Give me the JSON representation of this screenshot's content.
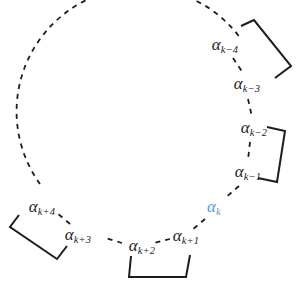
{
  "figure": {
    "type": "diagram",
    "background_color": "#ffffff",
    "stroke_color": "#1d1d1d",
    "highlight_color": "#5b9bd5",
    "alpha_symbol": "α"
  },
  "nodes": [
    {
      "id": "alpha-k-minus-4",
      "alpha": "α",
      "subscript": "k−4",
      "label": "αk−4",
      "x": 225,
      "y": 46,
      "color": "#1d1d1d",
      "highlighted": false
    },
    {
      "id": "alpha-k-minus-3",
      "alpha": "α",
      "subscript": "k−3",
      "label": "αk−3",
      "x": 247,
      "y": 85,
      "color": "#1d1d1d",
      "highlighted": false
    },
    {
      "id": "alpha-k-minus-2",
      "alpha": "α",
      "subscript": "k−2",
      "label": "αk−2",
      "x": 254,
      "y": 129,
      "color": "#1d1d1d",
      "highlighted": false
    },
    {
      "id": "alpha-k-minus-1",
      "alpha": "α",
      "subscript": "k−1",
      "label": "αk−1",
      "x": 248,
      "y": 173,
      "color": "#1d1d1d",
      "highlighted": false
    },
    {
      "id": "alpha-k",
      "alpha": "α",
      "subscript": "k",
      "label": "αk",
      "x": 214,
      "y": 208,
      "color": "#5b9bd5",
      "highlighted": true
    },
    {
      "id": "alpha-k-plus-1",
      "alpha": "α",
      "subscript": "k+1",
      "label": "αk+1",
      "x": 186,
      "y": 237,
      "color": "#1d1d1d",
      "highlighted": false
    },
    {
      "id": "alpha-k-plus-2",
      "alpha": "α",
      "subscript": "k+2",
      "label": "αk+2",
      "x": 142,
      "y": 247,
      "color": "#1d1d1d",
      "highlighted": false
    },
    {
      "id": "alpha-k-plus-3",
      "alpha": "α",
      "subscript": "k+3",
      "label": "αk+3",
      "x": 78,
      "y": 236,
      "color": "#1d1d1d",
      "highlighted": false
    },
    {
      "id": "alpha-k-plus-4",
      "alpha": "α",
      "subscript": "k+4",
      "label": "αk+4",
      "x": 42,
      "y": 208,
      "color": "#1d1d1d",
      "highlighted": false
    }
  ],
  "arc": {
    "id": "dashed-circle-arc",
    "center_x": 140,
    "center_y": 127,
    "radius": 115,
    "start_angle_deg": 150,
    "end_angle_deg": 332,
    "dash_pattern": "5 5",
    "stroke_width": 1.8
  },
  "connectors": [
    {
      "id": "connector-k-4-to-k-3",
      "from": "alpha-k-minus-4",
      "to": "alpha-k-minus-3",
      "x1": 233,
      "y1": 58,
      "x2": 243,
      "y2": 73
    },
    {
      "id": "connector-k-3-to-k-2",
      "from": "alpha-k-minus-3",
      "to": "alpha-k-minus-2",
      "x1": 248,
      "y1": 99,
      "x2": 252,
      "y2": 117
    },
    {
      "id": "connector-k-2-to-k-1",
      "from": "alpha-k-minus-2",
      "to": "alpha-k-minus-1",
      "x1": 250,
      "y1": 142,
      "x2": 248,
      "y2": 160
    },
    {
      "id": "connector-k-1-to-k",
      "from": "alpha-k-minus-1",
      "to": "alpha-k",
      "x1": 239,
      "y1": 186,
      "x2": 224,
      "y2": 199
    },
    {
      "id": "connector-k-to-k-1plus",
      "from": "alpha-k",
      "to": "alpha-k-plus-1",
      "x1": 205,
      "y1": 219,
      "x2": 192,
      "y2": 230
    },
    {
      "id": "connector-k1-to-k2",
      "from": "alpha-k-plus-1",
      "to": "alpha-k-plus-2",
      "x1": 168,
      "y1": 239,
      "x2": 154,
      "y2": 243
    },
    {
      "id": "connector-k2-to-k3",
      "from": "alpha-k-plus-2",
      "to": "alpha-k-plus-3",
      "x1": 122,
      "y1": 243,
      "x2": 104,
      "y2": 238
    },
    {
      "id": "connector-k3-to-k4",
      "from": "alpha-k-plus-3",
      "to": "alpha-k-plus-4",
      "x1": 70,
      "y1": 224,
      "x2": 56,
      "y2": 213
    }
  ],
  "brackets": [
    {
      "id": "bracket-top-right",
      "groups": [
        "alpha-k-minus-4",
        "alpha-k-minus-3"
      ],
      "points": "241,26 254,20 290,67 274,78",
      "tick_length": 9
    },
    {
      "id": "bracket-right",
      "groups": [
        "alpha-k-minus-2",
        "alpha-k-minus-1"
      ],
      "points": "268,128 285,131 277,182 259,179",
      "tick_length": 9
    },
    {
      "id": "bracket-bottom-left",
      "groups": [
        "alpha-k-plus-4",
        "alpha-k-plus-3"
      ],
      "points": "18,216 10,228 57,259 66,246",
      "tick_length": 9
    },
    {
      "id": "bracket-bottom-center",
      "groups": [
        "alpha-k-plus-2",
        "alpha-k-plus-1"
      ],
      "points": "131,258 129,277 186,277 189,256",
      "tick_length": 9
    }
  ]
}
